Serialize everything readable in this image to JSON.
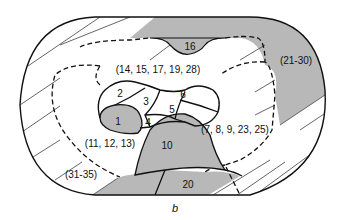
{
  "figure": {
    "caption": "b",
    "colors": {
      "shaded": "#b8b8b8",
      "outline": "#111111",
      "hatch": "#555555",
      "background": "#ffffff"
    },
    "outer_zone_labels": {
      "top_right": "(21-30)",
      "bottom_left": "(31-35)"
    },
    "middle_zone_labels": {
      "top": "(14, 15, 17, 19, 28)",
      "left": "(11, 12, 13)",
      "right": "(7, 8, 9, 23, 25)"
    },
    "regions": {
      "r1": "1",
      "r2": "2",
      "r3": "3",
      "r4": "4",
      "r5": "5",
      "r6": "6",
      "r10": "10",
      "r16": "16",
      "r20": "20"
    }
  }
}
